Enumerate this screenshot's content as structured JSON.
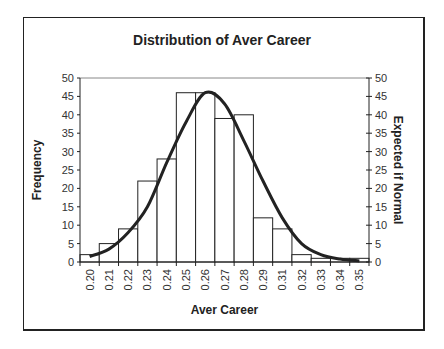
{
  "chart_data": {
    "type": "bar",
    "title": "Distribution of Aver Career",
    "xlabel": "Aver Career",
    "ylabel": "Frequency",
    "ylabel_right": "Expected if Normal",
    "ylim": [
      0,
      50
    ],
    "yticks": [
      0,
      5,
      10,
      15,
      20,
      25,
      30,
      35,
      40,
      45,
      50
    ],
    "grid": false,
    "legend": "none",
    "categories": [
      "0.20",
      "0.21",
      "0.22",
      "0.23",
      "0.24",
      "0.25",
      "0.26",
      "0.27",
      "0.28",
      "0.29",
      "0.31",
      "0.32",
      "0.33",
      "0.34",
      "0.35"
    ],
    "series": [
      {
        "name": "Frequency",
        "type": "bar",
        "values": [
          2,
          5,
          9,
          22,
          28,
          46,
          46,
          39,
          40,
          12,
          9,
          2,
          1,
          1,
          1
        ]
      },
      {
        "name": "Expected if Normal",
        "type": "line",
        "values": [
          1.5,
          3.5,
          8,
          15,
          27,
          38,
          46,
          43,
          33,
          22,
          12,
          5,
          2,
          0.8,
          0.3
        ]
      }
    ]
  },
  "labels": {
    "title": "Distribution of Aver Career",
    "xlabel": "Aver Career",
    "ylabel_left": "Frequency",
    "ylabel_right": "Expected if Normal"
  }
}
